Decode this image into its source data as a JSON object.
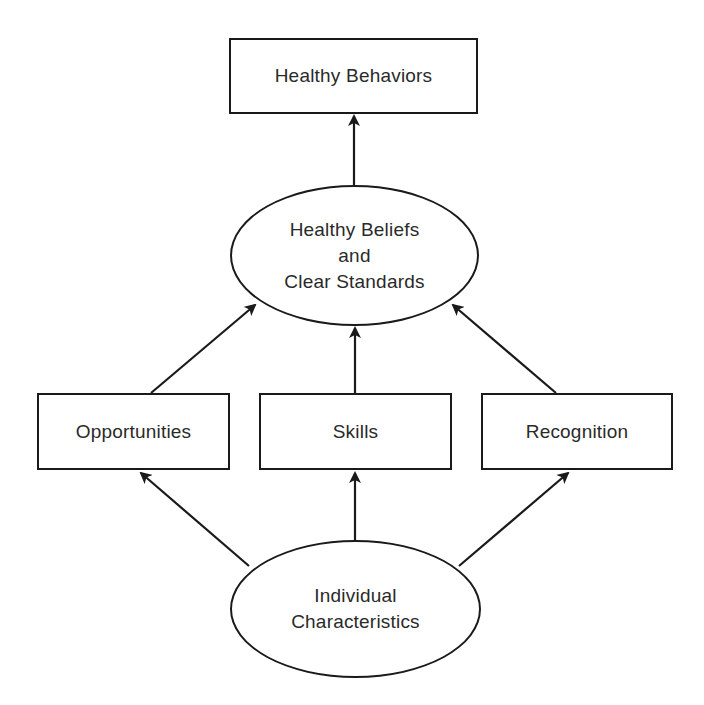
{
  "diagram": {
    "type": "flowchart",
    "stroke_color": "#1a1a1a",
    "text_color": "#2a2a2a",
    "background_color": "#ffffff",
    "nodes": {
      "healthy_behaviors": {
        "shape": "rectangle",
        "lines": [
          "Healthy Behaviors"
        ]
      },
      "healthy_beliefs": {
        "shape": "ellipse",
        "lines": [
          "Healthy Beliefs",
          "and",
          "Clear Standards"
        ]
      },
      "opportunities": {
        "shape": "rectangle",
        "lines": [
          "Opportunities"
        ]
      },
      "skills": {
        "shape": "rectangle",
        "lines": [
          "Skills"
        ]
      },
      "recognition": {
        "shape": "rectangle",
        "lines": [
          "Recognition"
        ]
      },
      "individual": {
        "shape": "ellipse",
        "lines": [
          "Individual",
          "Characteristics"
        ]
      }
    },
    "edges": [
      {
        "from": "Healthy Beliefs and Clear Standards",
        "to": "Healthy Behaviors"
      },
      {
        "from": "Opportunities",
        "to": "Healthy Beliefs and Clear Standards"
      },
      {
        "from": "Skills",
        "to": "Healthy Beliefs and Clear Standards"
      },
      {
        "from": "Recognition",
        "to": "Healthy Beliefs and Clear Standards"
      },
      {
        "from": "Individual Characteristics",
        "to": "Opportunities"
      },
      {
        "from": "Individual Characteristics",
        "to": "Skills"
      },
      {
        "from": "Individual Characteristics",
        "to": "Recognition"
      }
    ]
  }
}
